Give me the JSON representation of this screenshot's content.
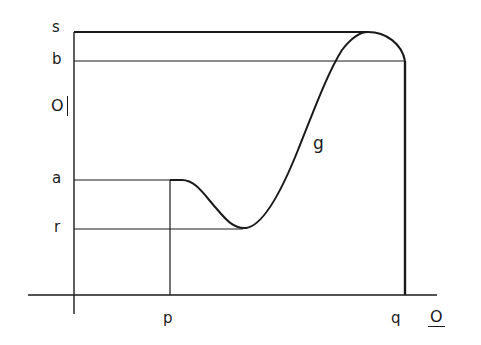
{
  "diagram": {
    "colors": {
      "ink": "#1a1a1a",
      "background": "#ffffff"
    },
    "y_axis_label": "O",
    "x_axis_label": "O",
    "y_labels": {
      "s": "s",
      "b": "b",
      "a": "a",
      "r": "r"
    },
    "x_labels": {
      "p": "p",
      "q": "q"
    },
    "curve_label": "g"
  }
}
